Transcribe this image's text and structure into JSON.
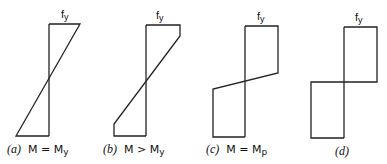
{
  "diagrams": [
    {
      "id": "a",
      "tag": "(a)",
      "label_main": "M = M",
      "label_sub": "y",
      "stress_label": "f",
      "stress_sub": "y",
      "points": "49,24 80,24 16,136 49,136",
      "axis": [
        49,
        24,
        49,
        136
      ]
    },
    {
      "id": "b",
      "tag": "(b)",
      "label_main": "M > M",
      "label_sub": "y",
      "stress_label": "f",
      "stress_sub": "y",
      "points": "146,25 180,25 180,36 114,124 114,136 146,136",
      "axis": [
        146,
        25,
        146,
        136
      ]
    },
    {
      "id": "c",
      "tag": "(c)",
      "label_main": "M = M",
      "label_sub": "p",
      "stress_label": "f",
      "stress_sub": "y",
      "points": "245,26 278,26 278,73 213,89 213,137 245,137",
      "axis": [
        245,
        26,
        245,
        137
      ]
    },
    {
      "id": "d",
      "tag": "(d)",
      "label_main": "",
      "label_sub": "",
      "stress_label": "f",
      "stress_sub": "y",
      "points": "344,27 377,27 377,82 311,82 311,138 344,138",
      "axis": [
        344,
        27,
        344,
        138
      ]
    }
  ]
}
